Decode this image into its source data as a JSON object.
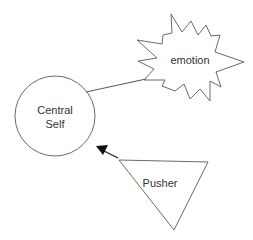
{
  "diagram": {
    "nodes": [
      {
        "id": "central-self",
        "shape": "circle",
        "label_lines": [
          "Central",
          "Self"
        ]
      },
      {
        "id": "emotion",
        "shape": "starburst",
        "label": "emotion"
      },
      {
        "id": "pusher",
        "shape": "inverted-triangle",
        "label": "Pusher"
      }
    ],
    "edges": [
      {
        "from": "central-self",
        "to": "emotion",
        "style": "line",
        "arrow": false
      },
      {
        "from": "pusher",
        "to": "central-self",
        "style": "arrow",
        "arrow": true
      }
    ],
    "colors": {
      "stroke": "#6a6a6a",
      "arrow": "#111111",
      "text": "#333333",
      "background": "#ffffff"
    }
  }
}
